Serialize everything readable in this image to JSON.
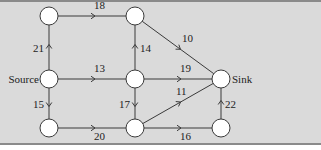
{
  "diagram": {
    "type": "flow-network",
    "nodes": [
      {
        "id": "A",
        "label": ""
      },
      {
        "id": "B",
        "label": ""
      },
      {
        "id": "S",
        "label": "Source"
      },
      {
        "id": "M",
        "label": ""
      },
      {
        "id": "T",
        "label": "Sink"
      },
      {
        "id": "C",
        "label": ""
      },
      {
        "id": "D",
        "label": ""
      },
      {
        "id": "E",
        "label": ""
      }
    ],
    "edges": [
      {
        "from": "A",
        "to": "B",
        "capacity": "18"
      },
      {
        "from": "S",
        "to": "A",
        "capacity": "21"
      },
      {
        "from": "M",
        "to": "B",
        "capacity": "14"
      },
      {
        "from": "B",
        "to": "T",
        "capacity": "10"
      },
      {
        "from": "S",
        "to": "M",
        "capacity": "13"
      },
      {
        "from": "M",
        "to": "T",
        "capacity": "19"
      },
      {
        "from": "S",
        "to": "C",
        "capacity": "15"
      },
      {
        "from": "M",
        "to": "D",
        "capacity": "17"
      },
      {
        "from": "D",
        "to": "T",
        "capacity": "11"
      },
      {
        "from": "C",
        "to": "D",
        "capacity": "20"
      },
      {
        "from": "D",
        "to": "E",
        "capacity": "16"
      },
      {
        "from": "E",
        "to": "T",
        "capacity": "22"
      }
    ]
  }
}
